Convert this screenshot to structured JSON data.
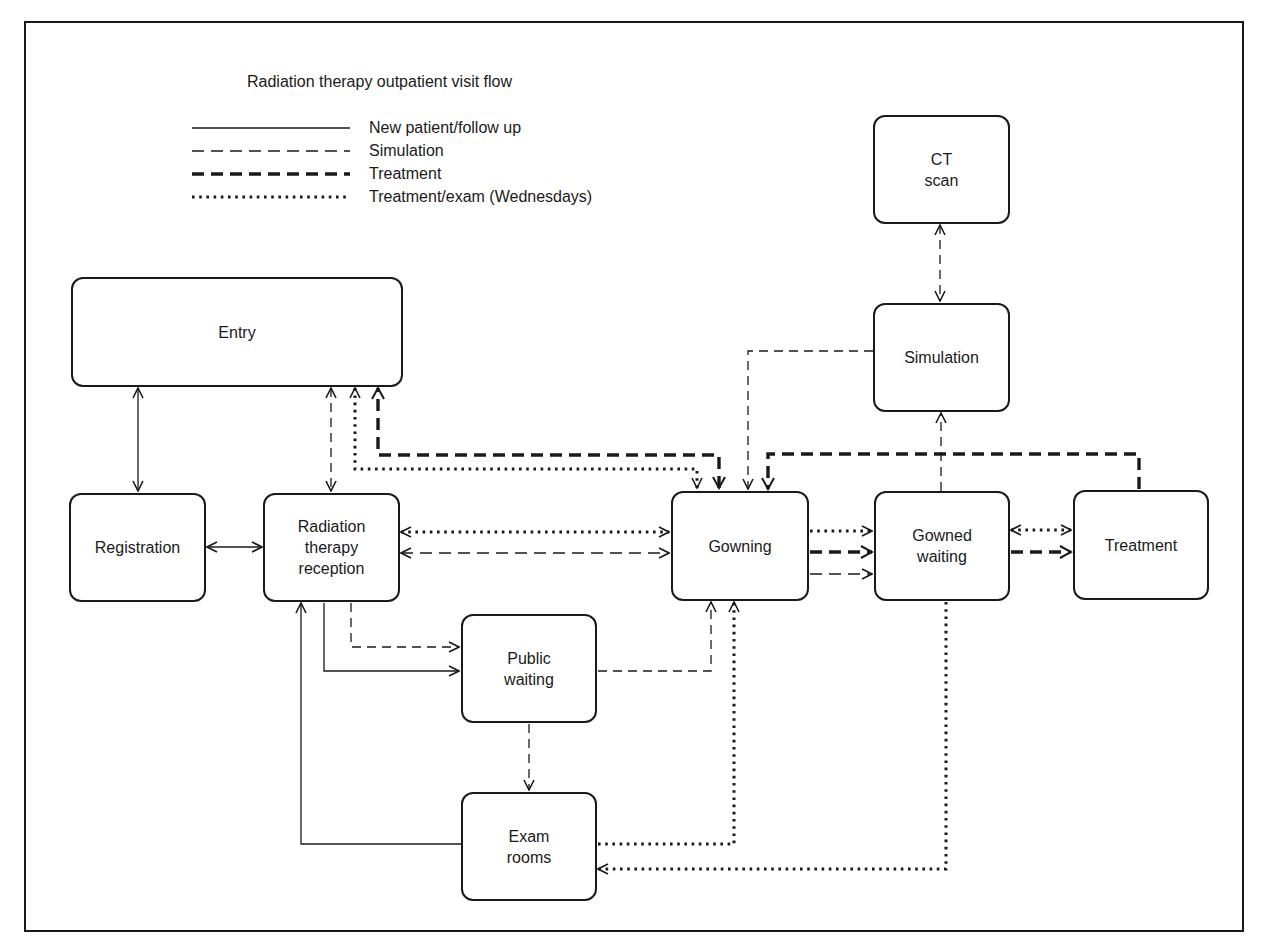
{
  "title": "Radiation therapy outpatient visit flow",
  "legend": [
    {
      "label": "New patient/follow up",
      "style": "solid"
    },
    {
      "label": "Simulation",
      "style": "dashed"
    },
    {
      "label": "Treatment",
      "style": "thick-dashed"
    },
    {
      "label": "Treatment/exam (Wednesdays)",
      "style": "dotted"
    }
  ],
  "nodes": {
    "entry": "Entry",
    "registration": "Registration",
    "rt_reception": "Radiation\ntherapy\nreception",
    "public_waiting": "Public\nwaiting",
    "exam_rooms": "Exam\nrooms",
    "gowning": "Gowning",
    "gowned_waiting": "Gowned\nwaiting",
    "treatment": "Treatment",
    "simulation": "Simulation",
    "ct_scan": "CT\nscan"
  },
  "edges": [
    {
      "from": "Entry",
      "to": "Registration",
      "style": "solid",
      "bidirectional": true
    },
    {
      "from": "Registration",
      "to": "Radiation therapy reception",
      "style": "solid",
      "bidirectional": true
    },
    {
      "from": "Entry",
      "to": "Radiation therapy reception",
      "style": "dashed",
      "bidirectional": true
    },
    {
      "from": "Gowning",
      "to": "Entry",
      "style": "dotted"
    },
    {
      "from": "Gowning",
      "to": "Entry",
      "style": "thick-dashed"
    },
    {
      "from": "Radiation therapy reception",
      "to": "Gowning",
      "style": "dotted",
      "bidirectional": true
    },
    {
      "from": "Radiation therapy reception",
      "to": "Gowning",
      "style": "dashed",
      "bidirectional": true
    },
    {
      "from": "Radiation therapy reception",
      "to": "Public waiting",
      "style": "dashed"
    },
    {
      "from": "Radiation therapy reception",
      "to": "Public waiting",
      "style": "solid"
    },
    {
      "from": "Public waiting",
      "to": "Gowning",
      "style": "dashed"
    },
    {
      "from": "Public waiting",
      "to": "Exam rooms",
      "style": "dashed"
    },
    {
      "from": "Exam rooms",
      "to": "Radiation therapy reception",
      "style": "solid"
    },
    {
      "from": "Exam rooms",
      "to": "Gowning",
      "style": "dotted"
    },
    {
      "from": "Gowned waiting",
      "to": "Exam rooms",
      "style": "dotted"
    },
    {
      "from": "Gowning",
      "to": "Gowned waiting",
      "style": "dotted"
    },
    {
      "from": "Gowning",
      "to": "Gowned waiting",
      "style": "thick-dashed"
    },
    {
      "from": "Gowning",
      "to": "Gowned waiting",
      "style": "dashed"
    },
    {
      "from": "Gowned waiting",
      "to": "Treatment",
      "style": "dotted",
      "bidirectional": true
    },
    {
      "from": "Gowned waiting",
      "to": "Treatment",
      "style": "thick-dashed"
    },
    {
      "from": "Treatment",
      "to": "Gowning",
      "style": "thick-dashed"
    },
    {
      "from": "Gowned waiting",
      "to": "Simulation",
      "style": "dashed"
    },
    {
      "from": "Simulation",
      "to": "Gowning",
      "style": "dashed"
    },
    {
      "from": "Simulation",
      "to": "CT scan",
      "style": "dashed",
      "bidirectional": true
    }
  ],
  "colors": {
    "stroke": "#1a1a1a",
    "background": "#ffffff"
  }
}
